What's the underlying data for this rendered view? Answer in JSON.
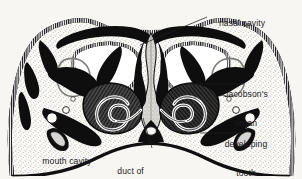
{
  "figure": {
    "type": "anatomical-cross-section",
    "background_color": "#f8f6f2",
    "ink_color": "#101010",
    "tissue_stipple_color": "#7b7b7b"
  },
  "labels": [
    {
      "id": "nasal-cavity",
      "text": "nasal cavity",
      "lines": [
        "nasal cavity"
      ],
      "align": "left",
      "x": 209,
      "y": 14
    },
    {
      "id": "jacobsons-organ",
      "text": "Jacobson's organ",
      "lines": [
        "Jacobson's",
        "organ"
      ],
      "align": "center",
      "x": 246,
      "y": 76
    },
    {
      "id": "developing-tooth",
      "text": "developing tooth",
      "lines": [
        "developing",
        "tooth"
      ],
      "align": "center",
      "x": 246,
      "y": 126
    },
    {
      "id": "mouth-cavity",
      "text": "mouth cavity",
      "lines": [
        "mouth cavity"
      ],
      "align": "center",
      "x": 67,
      "y": 143
    },
    {
      "id": "duct-of-jacobsons-organ",
      "text": "duct of Jacobson's organ",
      "lines": [
        "duct of",
        "Jacobson's organ"
      ],
      "align": "center",
      "x": 130,
      "y": 152
    }
  ],
  "leader_lines": [
    {
      "id": "leader-nasal-cavity",
      "from": [
        207,
        17
      ],
      "to": [
        140,
        45
      ]
    },
    {
      "id": "leader-jacobsons-organ",
      "from": [
        244,
        84
      ],
      "to": [
        186,
        84
      ]
    },
    {
      "id": "leader-developing-tooth",
      "from": [
        244,
        133
      ],
      "to": [
        200,
        133
      ]
    },
    {
      "id": "leader-duct-of-jacobsons-organ",
      "from": [
        152,
        148
      ],
      "to": [
        143,
        118
      ]
    }
  ]
}
